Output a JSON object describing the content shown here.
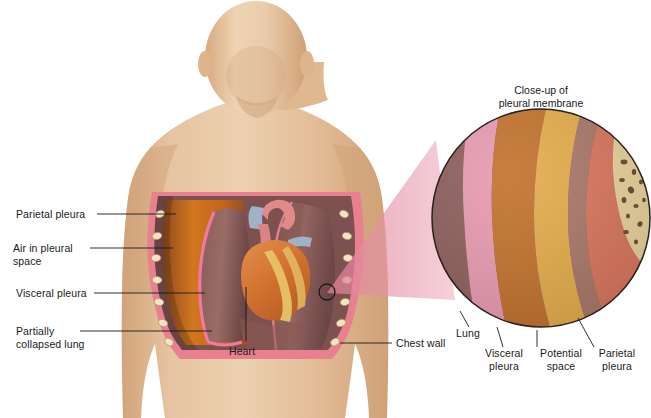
{
  "figure": {
    "closeup_title": "Close-up of\npleural membrane"
  },
  "labels": {
    "parietal_pleura": "Parietal pleura",
    "air_in_pleural_space": "Air in pleural\nspace",
    "visceral_pleura": "Visceral pleura",
    "partially_collapsed_lung": "Partially\ncollapsed lung",
    "heart": "Heart",
    "chest_wall": "Chest wall",
    "closeup_lung": "Lung",
    "closeup_visceral_pleura": "Visceral\npleura",
    "closeup_potential_space": "Potential\nspace",
    "closeup_parietal_pleura": "Parietal\npleura"
  },
  "colors": {
    "background": "#ffffff",
    "skin_light": "#e8c7a4",
    "skin_mid": "#ddb590",
    "skin_shadow": "#cda077",
    "skin_outline": "#b08b63",
    "chest_wall_pink": "#e9808f",
    "chest_wall_gold": "#e0a83f",
    "rib_cream": "#f0e2c2",
    "lung_mauve": "#8d5f5c",
    "lung_mauve_dark": "#6f4a49",
    "air_space_orange": "#c8691f",
    "visceral_line_pink": "#f178a0",
    "heart_orange": "#d4702f",
    "heart_fat_yellow": "#e8c66a",
    "vessel_pink": "#e08a8a",
    "vessel_blue": "#9fb2c8",
    "cone_pink": "#eda9bb",
    "closeup_lung": "#8d5f5c",
    "closeup_visceral": "#e89ab0",
    "closeup_space": "#c2712c",
    "closeup_parietal": "#e3ac4a",
    "closeup_band_mauve": "#a97868",
    "closeup_band_salmon": "#d9765c",
    "closeup_bone": "#e8d39a",
    "closeup_speckle": "#6b4a33",
    "leader_line": "#1a1a1a",
    "outline": "#2b2320"
  },
  "closeup_bands": [
    {
      "name": "lung",
      "color": "#8d5f5c"
    },
    {
      "name": "visceral-pleura",
      "color": "#e89ab0"
    },
    {
      "name": "potential-space",
      "color": "#c2712c"
    },
    {
      "name": "parietal-pleura",
      "color": "#e3ac4a"
    },
    {
      "name": "connective-band",
      "color": "#a97868"
    },
    {
      "name": "muscle-band",
      "color": "#d9765c"
    },
    {
      "name": "bone-marrow",
      "color": "#e8d39a"
    }
  ]
}
